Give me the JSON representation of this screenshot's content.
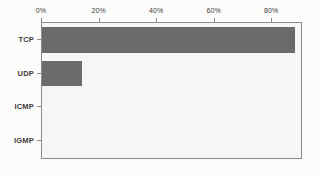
{
  "chart_data": {
    "type": "bar",
    "orientation": "horizontal",
    "title": "",
    "subtitle": "",
    "xlabel": "",
    "ylabel": "",
    "categories": [
      "TCP",
      "UDP",
      "ICMP",
      "IGMP"
    ],
    "values": [
      88,
      14,
      0,
      0
    ],
    "series": [
      {
        "name": "Protocol share",
        "values": [
          88,
          14,
          0,
          0
        ]
      }
    ],
    "xlim": [
      0,
      90
    ],
    "xticks": [
      0,
      20,
      40,
      60,
      80
    ],
    "xtick_labels": [
      "0%",
      "20%",
      "40%",
      "60%",
      "80%"
    ],
    "x_axis_position": "top",
    "y_axis_position": "left",
    "grid": false,
    "legend": false,
    "legend_position": "none",
    "annotations": []
  },
  "style": {
    "bar_color": "#6b6b6b",
    "plot_background": "#f6f6f5",
    "figure_background": "#fbfbfa",
    "axis_color": "#8a8a8a",
    "tick_text_color": "#3c3c3c"
  }
}
